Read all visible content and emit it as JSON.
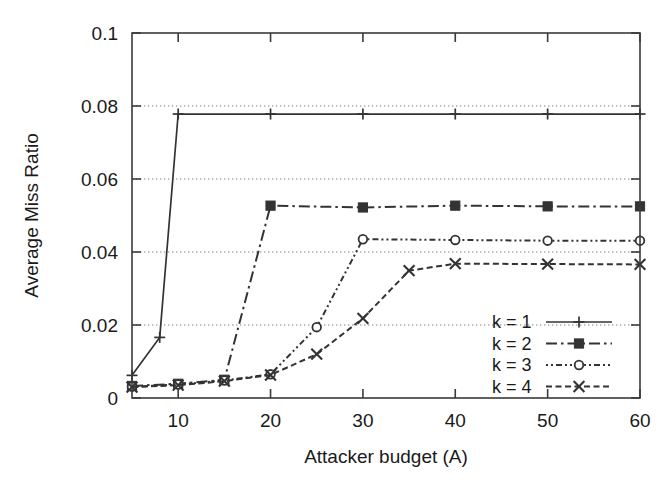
{
  "chart_data": {
    "type": "line",
    "title": "",
    "xlabel": "Attacker budget (A)",
    "ylabel": "Average Miss Ratio",
    "xlim": [
      5,
      60
    ],
    "ylim": [
      0,
      0.1
    ],
    "xticks": [
      10,
      20,
      30,
      40,
      50,
      60
    ],
    "xtick_labels": [
      "10",
      "20",
      "30",
      "40",
      "50",
      "60"
    ],
    "yticks": [
      0,
      0.02,
      0.04,
      0.06,
      0.08,
      0.1
    ],
    "ytick_labels": [
      "0",
      "0.02",
      "0.04",
      "0.06",
      "0.08",
      "0.1"
    ],
    "grid": "horizontal-dotted",
    "gridlines_y": [
      0.02,
      0.04,
      0.06,
      0.08
    ],
    "legend_position": "lower-right-inside",
    "background": "#ffffff",
    "series": [
      {
        "name": "k = 1",
        "marker": "plus",
        "dash": "solid",
        "color": "#333333",
        "x": [
          5,
          8,
          10,
          20,
          30,
          40,
          50,
          60
        ],
        "y": [
          0.0062,
          0.0166,
          0.0778,
          0.0778,
          0.0778,
          0.0778,
          0.0778,
          0.0778
        ]
      },
      {
        "name": "k = 2",
        "marker": "filled-square",
        "dash": "dash-dot",
        "color": "#333333",
        "x": [
          5,
          10,
          15,
          20,
          30,
          40,
          50,
          60
        ],
        "y": [
          0.0033,
          0.0039,
          0.005,
          0.0527,
          0.0522,
          0.0527,
          0.0525,
          0.0525
        ]
      },
      {
        "name": "k = 3",
        "marker": "open-circle",
        "dash": "dotted",
        "color": "#333333",
        "x": [
          5,
          10,
          15,
          20,
          25,
          30,
          40,
          50,
          60
        ],
        "y": [
          0.0031,
          0.0037,
          0.0048,
          0.0065,
          0.0194,
          0.0435,
          0.0433,
          0.0431,
          0.0431
        ]
      },
      {
        "name": "k = 4",
        "marker": "cross",
        "dash": "dashed",
        "color": "#333333",
        "x": [
          5,
          10,
          15,
          20,
          25,
          30,
          35,
          40,
          50,
          60
        ],
        "y": [
          0.003,
          0.0035,
          0.0046,
          0.0063,
          0.012,
          0.0218,
          0.0349,
          0.0368,
          0.0367,
          0.0366
        ]
      }
    ]
  },
  "legend": {
    "entries": [
      {
        "label": "k = 1"
      },
      {
        "label": "k = 2"
      },
      {
        "label": "k = 3"
      },
      {
        "label": "k = 4"
      }
    ]
  }
}
